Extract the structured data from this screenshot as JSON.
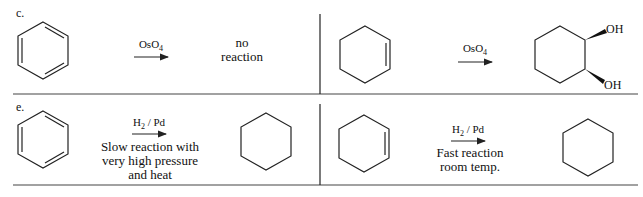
{
  "diagram": {
    "rows": [
      {
        "label": "c.",
        "left": {
          "reactant": "benzene",
          "reagent": "OsO",
          "reagent_sub": "4",
          "result_line1": "no",
          "result_line2": "reaction"
        },
        "right": {
          "reactant": "cyclohexene",
          "reagent": "OsO",
          "reagent_sub": "4",
          "product": "cis-1,2-cyclohexanediol",
          "oh_top": "OH",
          "oh_bottom": "OH"
        }
      },
      {
        "label": "e.",
        "left": {
          "reactant": "benzene",
          "reagent": "H",
          "reagent_sub": "2",
          "reagent_tail": " / Pd",
          "cond_line1": "Slow reaction with",
          "cond_line2": "very high pressure",
          "cond_line3": "and heat",
          "product": "cyclohexane"
        },
        "right": {
          "reactant": "cyclohexene",
          "reagent": "H",
          "reagent_sub": "2",
          "reagent_tail": " / Pd",
          "cond_line1": "Fast reaction",
          "cond_line2": "room temp.",
          "product": "cyclohexane"
        }
      }
    ],
    "line_color": "#222222"
  }
}
